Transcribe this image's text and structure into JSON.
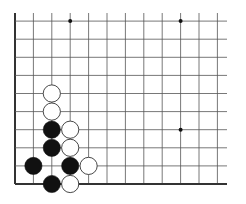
{
  "board": {
    "description": "Go board corner diagram (bottom-left corner)",
    "origin_x": 15,
    "origin_y": 184,
    "spacing_x": 18.4,
    "spacing_y": 18.1,
    "columns": 12,
    "rows": 10,
    "line_right_x": 227,
    "line_top_y": 13,
    "grid_color": "#555555",
    "edge_color": "#333333",
    "star_points": [
      {
        "col": 3,
        "row": 9
      },
      {
        "col": 9,
        "row": 9
      },
      {
        "col": 9,
        "row": 3
      }
    ],
    "stones": [
      {
        "color": "white",
        "col": 2,
        "row": 5
      },
      {
        "color": "white",
        "col": 2,
        "row": 4
      },
      {
        "color": "black",
        "col": 2,
        "row": 3
      },
      {
        "color": "white",
        "col": 3,
        "row": 3
      },
      {
        "color": "black",
        "col": 2,
        "row": 2
      },
      {
        "color": "white",
        "col": 3,
        "row": 2
      },
      {
        "color": "black",
        "col": 1,
        "row": 1
      },
      {
        "color": "black",
        "col": 3,
        "row": 1
      },
      {
        "color": "white",
        "col": 4,
        "row": 1
      },
      {
        "color": "black",
        "col": 2,
        "row": 0
      },
      {
        "color": "white",
        "col": 3,
        "row": 0
      }
    ]
  }
}
